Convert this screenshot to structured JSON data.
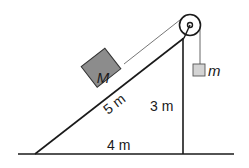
{
  "diagram": {
    "labels": {
      "block_big": "M",
      "block_small": "m",
      "hypotenuse": "5 m",
      "height": "3 m",
      "base": "4 m"
    },
    "colors": {
      "line": "#1a1a1a",
      "block_big_fill": "#8c8c8c",
      "block_small_fill": "#d4d4d4",
      "string": "#555555"
    }
  }
}
